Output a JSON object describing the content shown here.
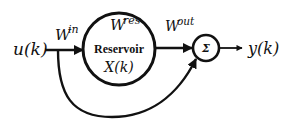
{
  "diagram": {
    "type": "reservoir-computing-block-diagram",
    "input": {
      "label": "u(k)"
    },
    "input_weight": {
      "label": "W",
      "superscript": "in"
    },
    "reservoir": {
      "weight_label": "W",
      "weight_superscript": "res",
      "title": "Reservoir",
      "state_label": "X(k)"
    },
    "output_weight": {
      "label": "W",
      "superscript": "out"
    },
    "summation": {
      "symbol": "Σ"
    },
    "output": {
      "label": "y(k)"
    },
    "edges": [
      {
        "from": "input",
        "to": "reservoir",
        "label": "W^in"
      },
      {
        "from": "reservoir",
        "to": "summation",
        "label": "W^out"
      },
      {
        "from": "input",
        "to": "summation",
        "label": "direct feedthrough"
      },
      {
        "from": "summation",
        "to": "output"
      }
    ],
    "colors": {
      "stroke": "#111111",
      "background": "#ffffff"
    }
  }
}
